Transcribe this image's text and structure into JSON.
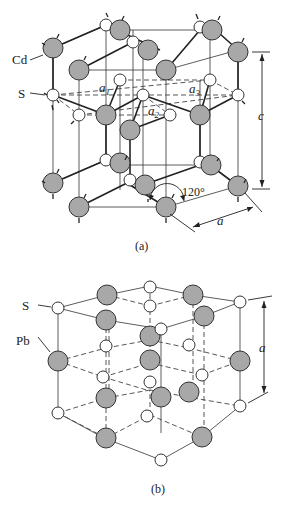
{
  "figure_a": {
    "caption": "(a)",
    "labels": {
      "cd": "Cd",
      "s": "S",
      "a1": "a",
      "a1_sub": "1",
      "a2": "a",
      "a2_sub": "2",
      "a3": "a",
      "a3_sub": "3",
      "c": "c",
      "angle": "120°",
      "a": "a"
    },
    "structure": "hexagonal (wurtzite-type) CdS"
  },
  "figure_b": {
    "caption": "(b)",
    "labels": {
      "s": "S",
      "pb": "Pb",
      "a": "a"
    },
    "structure": "cubic (rock-salt) PbS"
  },
  "colors": {
    "large_atom_fill": "#a8a8a8",
    "small_atom_fill": "#ffffff",
    "stroke": "#333333"
  }
}
